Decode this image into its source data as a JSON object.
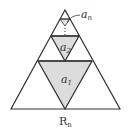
{
  "diagram": {
    "type": "nested-triangles",
    "labels": {
      "a1": {
        "base": "a",
        "sub": "1"
      },
      "a2": {
        "base": "a",
        "sub": "2"
      },
      "an": {
        "base": "a",
        "sub": "n"
      }
    },
    "caption": {
      "base": "R",
      "sub": "n"
    },
    "colors": {
      "stroke": "#333333",
      "fill": "#dcdcdc"
    }
  }
}
